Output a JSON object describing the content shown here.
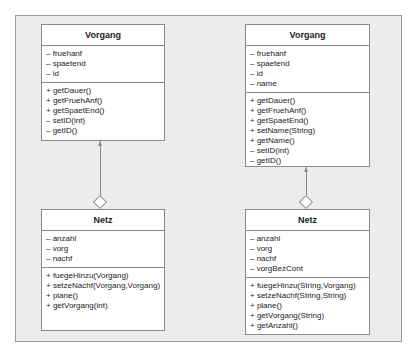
{
  "left": {
    "vorgang": {
      "name": "Vorgang",
      "attributes": [
        "– fruehanf",
        "– spaetend",
        "– id"
      ],
      "methods": [
        "+ getDauer()",
        "+ getFruehAnf()",
        "+ getSpaetEnd()",
        "– setID(int)",
        "– getID()"
      ]
    },
    "netz": {
      "name": "Netz",
      "attributes": [
        "– anzahl",
        "– vorg",
        "– nachf"
      ],
      "methods": [
        "+ fuegeHinzu(Vorgang)",
        "+ setzeNachf(Vorgang,Vorgang)",
        "+ plane()",
        "+ getVorgang(int)"
      ]
    }
  },
  "right": {
    "vorgang": {
      "name": "Vorgang",
      "attributes": [
        "– fruehanf",
        "– spaetend",
        "– id",
        "– name"
      ],
      "methods": [
        "+ getDauer()",
        "+ getFruehAnf()",
        "+ getSpaetEnd()",
        "+ setName(String)",
        "+ getName()",
        "– setID(int)",
        "– getID()"
      ]
    },
    "netz": {
      "name": "Netz",
      "attributes": [
        "– anzahl",
        "– vorg",
        "– nachf",
        "– vorgBezCont"
      ],
      "methods": [
        "+ fuegeHinzu(String,Vorgang)",
        "+ setzeNachf(String,String)",
        "+ plane()",
        "+ getVorgang(String)",
        "+ getAnzahl()"
      ]
    }
  },
  "relationship": {
    "type": "aggregation",
    "whole": "Netz",
    "part": "Vorgang"
  },
  "colors": {
    "panel_bg": "#ececec",
    "box_bg": "#ffffff",
    "border": "#8a8a8a"
  }
}
